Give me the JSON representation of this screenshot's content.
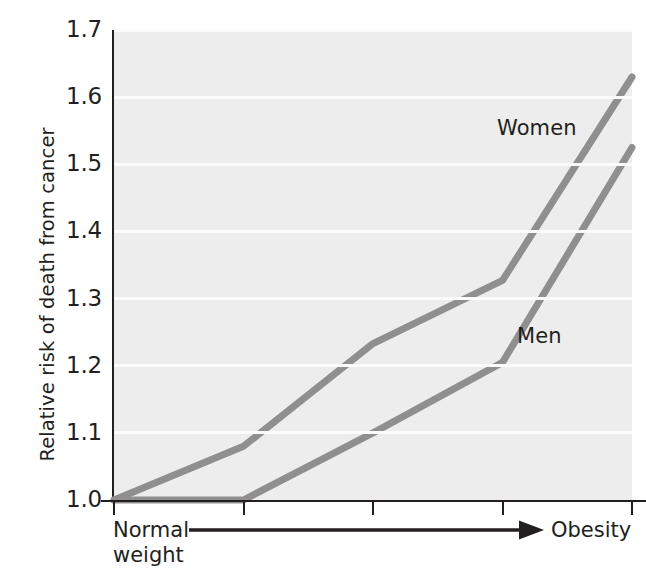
{
  "chart_data": {
    "type": "line",
    "title": "",
    "xlabel": "",
    "ylabel": "Relative risk of death from cancer",
    "ylim": [
      1.0,
      1.7
    ],
    "yticks": [
      "1.0",
      "1.1",
      "1.2",
      "1.3",
      "1.4",
      "1.5",
      "1.6",
      "1.7"
    ],
    "ytick_values": [
      1.0,
      1.1,
      1.2,
      1.3,
      1.4,
      1.5,
      1.6,
      1.7
    ],
    "grid": true,
    "grid_color": "#fbfbfb",
    "plot_background": "#ededed",
    "legend_position": "inline-annotation",
    "x": [
      1,
      2,
      3,
      4,
      5
    ],
    "xtick_labels": [
      "",
      "",
      "",
      "",
      ""
    ],
    "x_axis_annotation": {
      "start_label_line1": "Normal",
      "start_label_line2": "weight",
      "end_label": "Obesity",
      "arrow": "right-arrow"
    },
    "series": [
      {
        "name": "Women",
        "color": "#8f8f8f",
        "values": [
          1.0,
          1.08,
          1.233,
          1.327,
          1.63
        ]
      },
      {
        "name": "Men",
        "color": "#8f8f8f",
        "values": [
          1.0,
          1.0,
          1.1,
          1.205,
          1.525
        ]
      }
    ],
    "axis_color": "#231f20",
    "line_width": 7
  }
}
